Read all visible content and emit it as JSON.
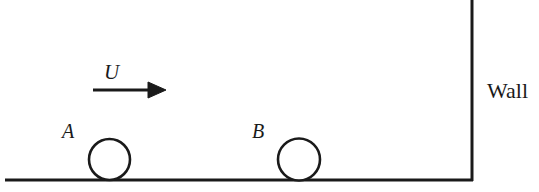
{
  "diagram": {
    "background_color": "#ffffff",
    "stroke_color": "#1a1a1a",
    "width": 539,
    "height": 192,
    "labels": {
      "velocity": "U",
      "ball_a": "A",
      "ball_b": "B",
      "wall": "Wall"
    },
    "elements": {
      "ground": {
        "name": "ground-line",
        "x1": 5,
        "y1": 180,
        "x2": 473,
        "y2": 180,
        "stroke_width": 3
      },
      "wall": {
        "name": "wall-line",
        "x1": 472,
        "y1": 0,
        "x2": 472,
        "y2": 181,
        "stroke_width": 3
      },
      "ball_a": {
        "name": "ball-a",
        "cx": 109.5,
        "cy": 159.5,
        "r": 20.5,
        "stroke_width": 2.6
      },
      "ball_b": {
        "name": "ball-b",
        "cx": 299,
        "cy": 159.5,
        "r": 21,
        "stroke_width": 2.6
      },
      "velocity_arrow": {
        "name": "velocity-arrow",
        "x1": 93,
        "y1": 90,
        "x2": 150,
        "y2": 90,
        "tip_x": 166,
        "head_half_height": 8,
        "stroke_width": 3
      }
    }
  }
}
